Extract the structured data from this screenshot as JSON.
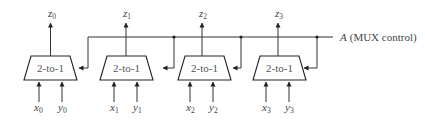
{
  "diagram": {
    "type": "circuit",
    "control": {
      "name": "A",
      "label_rest": "(MUX control)"
    },
    "muxes": [
      {
        "label": "2-to-1",
        "inputs": [
          {
            "var": "x",
            "sub": "0"
          },
          {
            "var": "y",
            "sub": "0"
          }
        ],
        "output": {
          "var": "z",
          "sub": "0"
        }
      },
      {
        "label": "2-to-1",
        "inputs": [
          {
            "var": "x",
            "sub": "1"
          },
          {
            "var": "y",
            "sub": "1"
          }
        ],
        "output": {
          "var": "z",
          "sub": "1"
        }
      },
      {
        "label": "2-to-1",
        "inputs": [
          {
            "var": "x",
            "sub": "2"
          },
          {
            "var": "y",
            "sub": "2"
          }
        ],
        "output": {
          "var": "z",
          "sub": "2"
        }
      },
      {
        "label": "2-to-1",
        "inputs": [
          {
            "var": "x",
            "sub": "3"
          },
          {
            "var": "y",
            "sub": "3"
          }
        ],
        "output": {
          "var": "z",
          "sub": "3"
        }
      }
    ],
    "colors": {
      "line": "#333333",
      "text": "#444444",
      "background": "#ffffff"
    }
  }
}
